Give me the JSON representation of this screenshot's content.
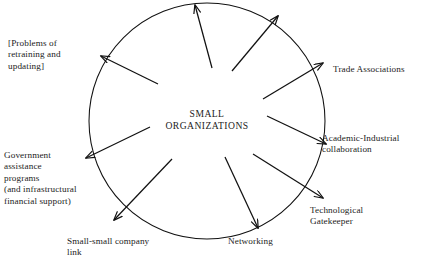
{
  "diagram": {
    "title_center": "SMALL\nORGANIZATIONS",
    "shape": "circle",
    "circle": {
      "cx": 207,
      "cy": 121,
      "r": 118
    },
    "stroke_color": "#111111",
    "background_color": "#ffffff",
    "nodes": [
      {
        "id": "retraining",
        "label": "[Problems of\nretraining and\nupdating]",
        "direction": "upper-left",
        "arrow_angle_deg": 208
      },
      {
        "id": "trade-associations",
        "label": "Trade Associations",
        "direction": "upper-right",
        "arrow_angle_deg": 328
      },
      {
        "id": "academic-industrial",
        "label": "Academic-Industrial\ncollaboration",
        "direction": "right",
        "arrow_angle_deg": 12
      },
      {
        "id": "technological-gatekeeper",
        "label": "Technological\nGatekeeper",
        "direction": "lower-right",
        "arrow_angle_deg": 40
      },
      {
        "id": "networking",
        "label": "Networking",
        "direction": "bottom",
        "arrow_angle_deg": 76
      },
      {
        "id": "small-small-company",
        "label": "Small-small company\nlink",
        "direction": "lower-left",
        "arrow_angle_deg": 130
      },
      {
        "id": "government-assistance",
        "label": "Government\nassistance\nprograms\n(and infrastructural\nfinancial support)",
        "direction": "left",
        "arrow_angle_deg": 172
      },
      {
        "id": "top-arrow",
        "label": "",
        "direction": "top",
        "arrow_angle_deg": 264
      }
    ]
  }
}
